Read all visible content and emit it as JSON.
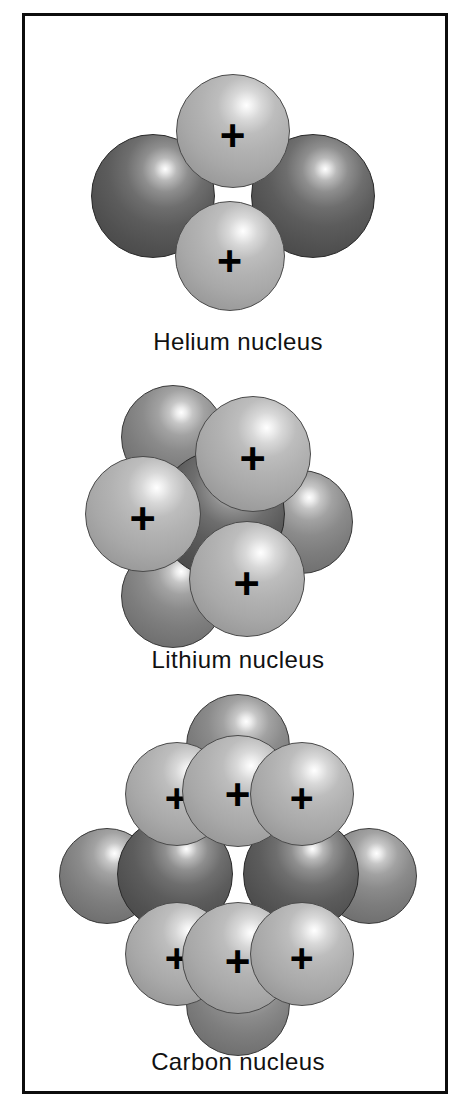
{
  "figure": {
    "background_color": "#ffffff",
    "frame_color": "#0d0d0d",
    "proton_color": "#b0b0b0",
    "neutron_color": "#585858",
    "charge_symbol": "+",
    "label_color": "#111111"
  },
  "panels": [
    {
      "id": "helium",
      "caption": "Helium nucleus",
      "proton_count": 2,
      "neutron_count": 2,
      "protons": [
        {
          "cx": 208,
          "cy": 85,
          "r": 57,
          "plus": true
        },
        {
          "cx": 205,
          "cy": 210,
          "r": 55,
          "plus": true
        }
      ],
      "neutrons": [
        {
          "cx": 128,
          "cy": 150,
          "r": 62,
          "back": false
        },
        {
          "cx": 288,
          "cy": 150,
          "r": 62,
          "back": false
        }
      ]
    },
    {
      "id": "lithium",
      "caption": "Lithium nucleus",
      "proton_count": 3,
      "neutron_count": 4,
      "protons": [
        {
          "cx": 228,
          "cy": 80,
          "r": 58,
          "plus": true
        },
        {
          "cx": 118,
          "cy": 140,
          "r": 58,
          "plus": true
        },
        {
          "cx": 222,
          "cy": 205,
          "r": 58,
          "plus": true
        }
      ],
      "neutrons": [
        {
          "cx": 148,
          "cy": 63,
          "r": 52,
          "back": true
        },
        {
          "cx": 276,
          "cy": 148,
          "r": 52,
          "back": true
        },
        {
          "cx": 148,
          "cy": 222,
          "r": 52,
          "back": true
        },
        {
          "cx": 196,
          "cy": 140,
          "r": 64,
          "back": false
        }
      ]
    },
    {
      "id": "carbon",
      "caption": "Carbon nucleus",
      "proton_count": 6,
      "neutron_count": 6,
      "protons": [
        {
          "cx": 152,
          "cy": 78,
          "r": 52,
          "plus": true
        },
        {
          "cx": 213,
          "cy": 75,
          "r": 56,
          "plus": true
        },
        {
          "cx": 277,
          "cy": 78,
          "r": 52,
          "plus": true
        },
        {
          "cx": 152,
          "cy": 238,
          "r": 52,
          "plus": true
        },
        {
          "cx": 213,
          "cy": 242,
          "r": 56,
          "plus": true
        },
        {
          "cx": 277,
          "cy": 238,
          "r": 52,
          "plus": true
        }
      ],
      "neutrons": [
        {
          "cx": 213,
          "cy": 30,
          "r": 52,
          "back": true
        },
        {
          "cx": 213,
          "cy": 288,
          "r": 52,
          "back": true
        },
        {
          "cx": 82,
          "cy": 160,
          "r": 48,
          "back": true
        },
        {
          "cx": 344,
          "cy": 160,
          "r": 48,
          "back": true
        },
        {
          "cx": 150,
          "cy": 158,
          "r": 58,
          "back": false
        },
        {
          "cx": 276,
          "cy": 158,
          "r": 58,
          "back": false
        }
      ]
    }
  ],
  "layout": {
    "panel_tops": [
      30,
      358,
      700
    ],
    "stage_heights": [
      270,
      262,
      322
    ],
    "caption_offsets": [
      282,
      272,
      332
    ]
  }
}
